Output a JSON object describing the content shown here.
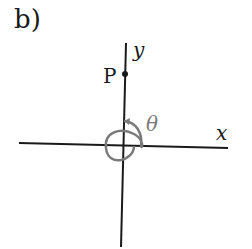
{
  "figure": {
    "part_label": "b)",
    "axes": {
      "x_label": "x",
      "y_label": "y"
    },
    "point": {
      "label": "P",
      "location": "positive y-axis"
    },
    "angle": {
      "label": "θ",
      "description": "counterclockwise spiral arc from positive x-axis, one full turn plus a quarter turn, ending on positive y-axis with arrowhead"
    },
    "colors": {
      "axes": "#1a1a1a",
      "arc": "#7a7a7a"
    }
  }
}
